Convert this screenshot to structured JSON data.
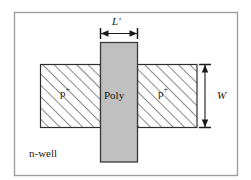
{
  "figure": {
    "frame": {
      "name": "figure-border",
      "stroke": "#9a9a9a",
      "fill": "#ffffff"
    },
    "regions": {
      "diffusion": {
        "label_left": "p",
        "label_left_sup": "+",
        "label_right": "p",
        "label_right_sup": "+",
        "hatch_color": "#4d4d4d",
        "fill": "#ffffff",
        "stroke": "#333333"
      },
      "gate": {
        "label": "Poly",
        "fill": "#c0c0c0",
        "stroke": "#3a3a3a"
      },
      "substrate": {
        "label": "n-well",
        "fill": "#ffffff"
      }
    },
    "dimensions": {
      "length": {
        "label": "L",
        "prime": "′",
        "orientation": "horizontal",
        "color": "#1a1a1a"
      },
      "width": {
        "label": "W",
        "orientation": "vertical",
        "color": "#1a1a1a"
      }
    }
  }
}
